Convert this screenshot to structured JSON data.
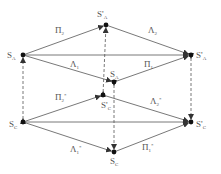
{
  "diagram": {
    "nodes": [
      {
        "id": "SpA_top",
        "label": "S",
        "prime": "'",
        "sub": "A",
        "x": 106,
        "y": 25,
        "lx": 97,
        "ly": 17
      },
      {
        "id": "SA_left",
        "label": "S",
        "prime": "",
        "sub": "A",
        "x": 23,
        "y": 55,
        "lx": 7,
        "ly": 58
      },
      {
        "id": "SpA_right",
        "label": "S",
        "prime": "'",
        "sub": "A",
        "x": 191,
        "y": 55,
        "lx": 196,
        "ly": 58
      },
      {
        "id": "SA_mid",
        "label": "S",
        "prime": "",
        "sub": "A",
        "x": 114,
        "y": 82,
        "lx": 110,
        "ly": 77
      },
      {
        "id": "SpC_mid",
        "label": "S",
        "prime": "'",
        "sub": "C",
        "x": 103,
        "y": 95,
        "lx": 101,
        "ly": 108
      },
      {
        "id": "SC_left",
        "label": "S",
        "prime": "",
        "sub": "C",
        "x": 23,
        "y": 122,
        "lx": 9,
        "ly": 127
      },
      {
        "id": "SpC_right",
        "label": "S",
        "prime": "'",
        "sub": "C",
        "x": 191,
        "y": 122,
        "lx": 196,
        "ly": 127
      },
      {
        "id": "SC_bottom",
        "label": "S",
        "prime": "",
        "sub": "C",
        "x": 114,
        "y": 152,
        "lx": 110,
        "ly": 164
      }
    ],
    "edges": [
      {
        "from": "SA_left",
        "to": "SpA_top",
        "label": "Π",
        "sub": "2",
        "star": "",
        "lx": 55,
        "ly": 33
      },
      {
        "from": "SpA_top",
        "to": "SpA_right",
        "label": "Λ",
        "sub": "2",
        "star": "",
        "lx": 148,
        "ly": 33
      },
      {
        "from": "SA_left",
        "to": "SA_mid",
        "label": "Λ",
        "sub": "1",
        "star": "",
        "lx": 70,
        "ly": 67
      },
      {
        "from": "SA_mid",
        "to": "SpA_right",
        "label": "Π",
        "sub": "1",
        "star": "",
        "lx": 144,
        "ly": 67
      },
      {
        "from": "SA_left",
        "to": "SpA_right",
        "label": "",
        "sub": "",
        "star": "",
        "lx": 0,
        "ly": 0
      },
      {
        "from": "SC_left",
        "to": "SpC_mid",
        "label": "Π",
        "sub": "2",
        "star": "*",
        "lx": 55,
        "ly": 100
      },
      {
        "from": "SpC_mid",
        "to": "SpC_right",
        "label": "Λ",
        "sub": "2",
        "star": "*",
        "lx": 150,
        "ly": 104
      },
      {
        "from": "SC_left",
        "to": "SC_bottom",
        "label": "Λ",
        "sub": "1",
        "star": "*",
        "lx": 70,
        "ly": 152
      },
      {
        "from": "SC_bottom",
        "to": "SpC_right",
        "label": "Π",
        "sub": "1",
        "star": "*",
        "lx": 142,
        "ly": 150
      },
      {
        "from": "SC_left",
        "to": "SpC_right",
        "label": "",
        "sub": "",
        "star": "",
        "lx": 0,
        "ly": 0
      }
    ],
    "dashed": [
      {
        "from": "SC_left",
        "to": "SA_left"
      },
      {
        "from": "SpC_mid",
        "to": "SpA_top"
      },
      {
        "from": "SA_mid",
        "to": "SC_bottom"
      },
      {
        "from": "SpA_right",
        "to": "SpC_right"
      }
    ],
    "colors": {
      "line": "#555555",
      "node": "#111111",
      "text": "#555555"
    }
  }
}
